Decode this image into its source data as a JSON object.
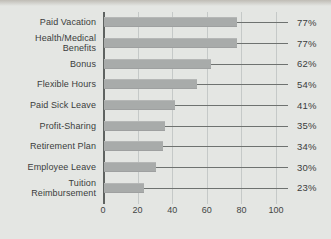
{
  "chart_data": {
    "type": "bar",
    "orientation": "horizontal",
    "title": "",
    "xlabel": "",
    "ylabel": "",
    "categories": [
      "Paid Vacation",
      "Health/Medical\nBenefits",
      "Bonus",
      "Flexible Hours",
      "Paid Sick Leave",
      "Profit-Sharing",
      "Retirement Plan",
      "Employee Leave",
      "Tuition\nReimbursement"
    ],
    "values": [
      77,
      77,
      62,
      54,
      41,
      35,
      34,
      30,
      23
    ],
    "value_labels": [
      "77%",
      "77%",
      "62%",
      "54%",
      "41%",
      "35%",
      "34%",
      "30%",
      "23%"
    ],
    "xlim": [
      0,
      100
    ],
    "xticks": [
      0,
      20,
      40,
      60,
      80,
      100
    ],
    "xtick_labels": [
      "0",
      "20",
      "40",
      "60",
      "80",
      "100"
    ],
    "grid": true,
    "legend": "none",
    "colors": {
      "background": "#e4e6e3",
      "bar": "#a8abaa",
      "gridline": "#c5c9c8",
      "axis_line": "#5f6361",
      "leader_line": "#6e7270",
      "text": "#3b3d3c"
    }
  }
}
